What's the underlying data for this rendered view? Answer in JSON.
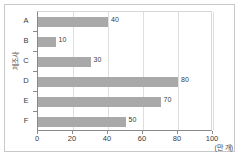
{
  "chart_data": {
    "type": "bar",
    "orientation": "horizontal",
    "title": "",
    "categories": [
      "A",
      "B",
      "C",
      "D",
      "E",
      "F"
    ],
    "values": [
      40,
      10,
      30,
      80,
      70,
      50
    ],
    "data_labels": [
      "40",
      "10",
      "30",
      "80",
      "70",
      "50"
    ],
    "xlabel": "(만 개)",
    "ylabel": "제조사",
    "xlim": [
      0,
      100
    ],
    "xticks": [
      0,
      20,
      40,
      60,
      80,
      100
    ],
    "xtick_labels": [
      "0",
      "20",
      "40",
      "60",
      "80",
      "100"
    ],
    "grid": "vertical",
    "legend": "none",
    "bar_color": "#a9a9a9",
    "axis_color": "#8a8a8a",
    "gridline_color": "#dedede",
    "background_color": "#ffffff"
  }
}
